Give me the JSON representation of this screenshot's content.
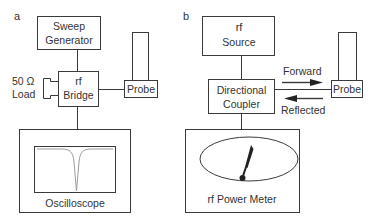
{
  "panel_a": {
    "label": "a",
    "sweep_generator": {
      "line1": "Sweep",
      "line2": "Generator"
    },
    "bridge": {
      "line1": "rf",
      "line2": "Bridge"
    },
    "load": {
      "line1": "50 Ω",
      "line2": "Load"
    },
    "probe": "Probe",
    "oscilloscope": "Oscilloscope"
  },
  "panel_b": {
    "label": "b",
    "source": {
      "line1": "rf",
      "line2": "Source"
    },
    "coupler": {
      "line1": "Directional",
      "line2": "Coupler"
    },
    "probe": "Probe",
    "forward": "Forward",
    "reflected": "Reflected",
    "power_meter": "rf Power Meter"
  },
  "colors": {
    "stroke": "#3a3a3a",
    "text": "#333333",
    "trace": "#9a9a9a",
    "needle": "#222222"
  }
}
